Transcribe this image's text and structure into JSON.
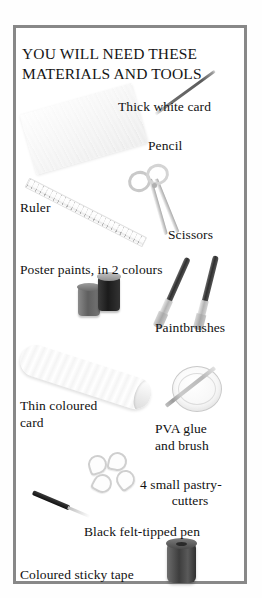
{
  "page": {
    "background_color": "#ffffff",
    "frame_border_color": "#888888"
  },
  "panel": {
    "title_line1": "YOU WILL NEED THESE",
    "title_line2": "MATERIALS AND TOOLS",
    "labels": {
      "thick_white_card": "Thick white card",
      "pencil": "Pencil",
      "ruler": "Ruler",
      "scissors": "Scissors",
      "poster_paints": "Poster paints, in 2 colours",
      "paintbrushes": "Paintbrushes",
      "thin_coloured_card_line1": "Thin coloured",
      "thin_coloured_card_line2": "card",
      "pva_glue_line1": "PVA  glue",
      "pva_glue_line2": "and brush",
      "pastry_cutters_line1": "4 small pastry-",
      "pastry_cutters_line2": "cutters",
      "felt_tipped_pen": "Black felt-tipped pen",
      "sticky_tape": "Coloured sticky tape"
    },
    "items": [
      {
        "name": "thick-white-card",
        "label": "Thick white card",
        "color": "#f2f2f2"
      },
      {
        "name": "pencil",
        "label": "Pencil",
        "color": "#6b6b6b"
      },
      {
        "name": "ruler",
        "label": "Ruler",
        "color": "#eaeaea"
      },
      {
        "name": "scissors",
        "label": "Scissors",
        "color": "#cfcfcf"
      },
      {
        "name": "poster-paints",
        "label": "Poster paints, in 2 colours",
        "count": 2,
        "color": "#1b1b1b"
      },
      {
        "name": "paintbrushes",
        "label": "Paintbrushes",
        "count": 2,
        "color": "#2e2e2e"
      },
      {
        "name": "thin-coloured-card",
        "label": "Thin coloured card",
        "color": "#ededed"
      },
      {
        "name": "pva-glue-and-brush",
        "label": "PVA glue and brush",
        "color": "#f7f7f7"
      },
      {
        "name": "pastry-cutters",
        "label": "4 small pastry-cutters",
        "count": 4,
        "color": "#cfcfcf"
      },
      {
        "name": "black-felt-tipped-pen",
        "label": "Black felt-tipped pen",
        "color": "#101010"
      },
      {
        "name": "coloured-sticky-tape",
        "label": "Coloured sticky tape",
        "color": "#3d3d3d"
      }
    ]
  }
}
